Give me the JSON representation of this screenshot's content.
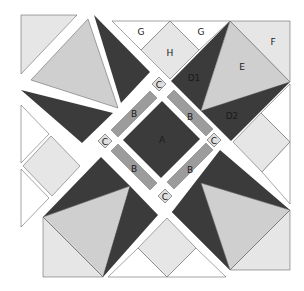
{
  "diagram": {
    "type": "quilt-block-piecing-diagram",
    "labels": {
      "A": "A",
      "B": "B",
      "C": "C",
      "D1": "D1",
      "D2": "D2",
      "E": "E",
      "F": "F",
      "G": "G",
      "H": "H"
    },
    "colors": {
      "dark": "#3b3b3b",
      "medium_light": "#cfcfcf",
      "light": "#e6e6e6",
      "b_strip": "#9c9c9c",
      "c_square": "#dedede",
      "background": "#ffffff"
    }
  }
}
